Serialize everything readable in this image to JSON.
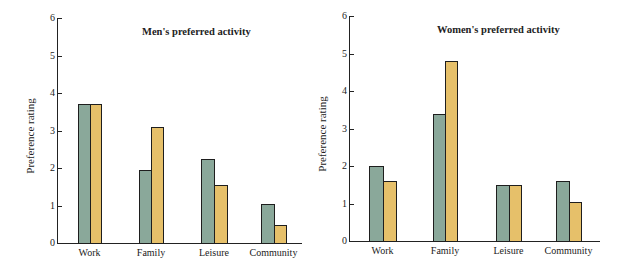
{
  "colors": {
    "series_a": "#8aa89a",
    "series_b": "#e6c06a"
  },
  "chart_data": [
    {
      "type": "bar",
      "title": "Men's preferred activity",
      "xlabel": "",
      "ylabel": "Preference rating",
      "ylim": [
        0,
        6
      ],
      "yticks": [
        "0",
        "1",
        "2",
        "3",
        "4",
        "5",
        "6"
      ],
      "categories": [
        "Work",
        "Family",
        "Leisure",
        "Community"
      ],
      "series": [
        {
          "name": "Series A (green)",
          "values": [
            3.7,
            1.95,
            2.25,
            1.05
          ]
        },
        {
          "name": "Series B (yellow)",
          "values": [
            3.7,
            3.1,
            1.55,
            0.48
          ]
        }
      ],
      "grid": false,
      "legend": "none"
    },
    {
      "type": "bar",
      "title": "Women's preferred activity",
      "xlabel": "",
      "ylabel": "Preference rating",
      "ylim": [
        0,
        6
      ],
      "yticks": [
        "0",
        "1",
        "2",
        "3",
        "4",
        "5",
        "6"
      ],
      "categories": [
        "Work",
        "Family",
        "Leisure",
        "Community"
      ],
      "series": [
        {
          "name": "Series A (green)",
          "values": [
            2.0,
            3.4,
            1.5,
            1.6
          ]
        },
        {
          "name": "Series B (yellow)",
          "values": [
            1.6,
            4.8,
            1.5,
            1.03
          ]
        }
      ],
      "grid": false,
      "legend": "none"
    }
  ]
}
